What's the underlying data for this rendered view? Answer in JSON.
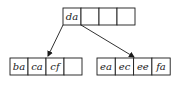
{
  "diagram": {
    "type": "b-tree",
    "root": {
      "keys": [
        "da",
        "",
        "",
        ""
      ]
    },
    "children": [
      {
        "keys": [
          "ba",
          "ca",
          "cf",
          ""
        ]
      },
      {
        "keys": [
          "ea",
          "ec",
          "ee",
          "fa"
        ]
      }
    ],
    "edges": [
      {
        "from": "root.pointer-0",
        "to": "children.0"
      },
      {
        "from": "root.pointer-1",
        "to": "children.1"
      }
    ],
    "colors": {
      "line": "#1a1a1a",
      "fill": "#ffffff"
    }
  }
}
